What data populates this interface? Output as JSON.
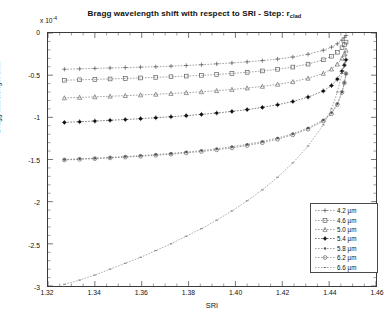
{
  "chart_data": {
    "type": "line",
    "title": "Bragg wavelength shift with respect to SRI - Step: r",
    "title_sub": "clad",
    "xlabel": "SRI",
    "ylabel": "Bragg wavelength shift",
    "y_multiplier": "x 10",
    "y_multiplier_exp": "-4",
    "xlim": [
      1.32,
      1.46
    ],
    "ylim": [
      -3,
      0
    ],
    "xticks": [
      "1.32",
      "1.34",
      "1.36",
      "1.38",
      "1.40",
      "1.42",
      "1.44",
      "1.46"
    ],
    "xtick_values": [
      1.32,
      1.34,
      1.36,
      1.38,
      1.4,
      1.42,
      1.44,
      1.46
    ],
    "yticks": [
      "0",
      "-0.5",
      "-1",
      "-1.5",
      "-2",
      "-2.5",
      "-3"
    ],
    "ytick_values": [
      0,
      -0.5,
      -1,
      -1.5,
      -2,
      -2.5,
      -3
    ],
    "grid": false,
    "minor_ticks": true,
    "legend_position": "lower right",
    "legend_title": "",
    "x": [
      1.327,
      1.3335,
      1.34,
      1.3465,
      1.353,
      1.3595,
      1.366,
      1.3725,
      1.379,
      1.3855,
      1.392,
      1.3985,
      1.405,
      1.4115,
      1.418,
      1.4245,
      1.431,
      1.4375,
      1.441,
      1.4435,
      1.4455,
      1.4465,
      1.4472
    ],
    "series": [
      {
        "name": "4.2 µm",
        "marker": "plus",
        "filled": false,
        "color": "#555555",
        "values": [
          -0.43,
          -0.425,
          -0.42,
          -0.415,
          -0.41,
          -0.405,
          -0.4,
          -0.393,
          -0.385,
          -0.376,
          -0.366,
          -0.355,
          -0.342,
          -0.327,
          -0.309,
          -0.285,
          -0.252,
          -0.205,
          -0.168,
          -0.128,
          -0.085,
          -0.055,
          -0.03
        ]
      },
      {
        "name": "4.6 µm",
        "marker": "square",
        "filled": false,
        "color": "#555555",
        "values": [
          -0.56,
          -0.555,
          -0.55,
          -0.545,
          -0.539,
          -0.533,
          -0.526,
          -0.519,
          -0.511,
          -0.502,
          -0.492,
          -0.48,
          -0.466,
          -0.45,
          -0.43,
          -0.404,
          -0.369,
          -0.318,
          -0.275,
          -0.228,
          -0.175,
          -0.138,
          -0.108
        ]
      },
      {
        "name": "5.0 µm",
        "marker": "triangle",
        "filled": false,
        "color": "#555555",
        "values": [
          -0.77,
          -0.764,
          -0.757,
          -0.75,
          -0.743,
          -0.735,
          -0.727,
          -0.718,
          -0.708,
          -0.697,
          -0.684,
          -0.67,
          -0.653,
          -0.633,
          -0.609,
          -0.578,
          -0.537,
          -0.479,
          -0.428,
          -0.37,
          -0.3,
          -0.25,
          -0.205
        ]
      },
      {
        "name": "5.4 µm",
        "marker": "star",
        "filled": true,
        "color": "#111111",
        "values": [
          -1.06,
          -1.052,
          -1.044,
          -1.035,
          -1.026,
          -1.016,
          -1.005,
          -0.993,
          -0.98,
          -0.965,
          -0.949,
          -0.93,
          -0.908,
          -0.882,
          -0.851,
          -0.812,
          -0.76,
          -0.688,
          -0.623,
          -0.546,
          -0.452,
          -0.382,
          -0.318
        ]
      },
      {
        "name": "5.8 µm",
        "marker": "dot",
        "filled": true,
        "color": "#555555",
        "values": [
          -1.5,
          -1.492,
          -1.484,
          -1.475,
          -1.465,
          -1.454,
          -1.442,
          -1.428,
          -1.412,
          -1.394,
          -1.373,
          -1.349,
          -1.321,
          -1.287,
          -1.246,
          -1.194,
          -1.126,
          -1.032,
          -0.947,
          -0.84,
          -0.7,
          -0.59,
          -0.48
        ]
      },
      {
        "name": "6.2 µm",
        "marker": "circle",
        "filled": false,
        "color": "#555555",
        "values": [
          -1.505,
          -1.498,
          -1.49,
          -1.481,
          -1.472,
          -1.462,
          -1.45,
          -1.437,
          -1.422,
          -1.405,
          -1.385,
          -1.362,
          -1.334,
          -1.301,
          -1.26,
          -1.208,
          -1.14,
          -1.044,
          -0.958,
          -0.848,
          -0.704,
          -0.592,
          -0.482
        ]
      },
      {
        "name": "6.6 µm",
        "marker": "dash",
        "filled": false,
        "color": "#666666",
        "values": [
          -2.98,
          -2.93,
          -2.87,
          -2.8,
          -2.73,
          -2.66,
          -2.58,
          -2.5,
          -2.41,
          -2.32,
          -2.22,
          -2.11,
          -1.99,
          -1.86,
          -1.71,
          -1.54,
          -1.34,
          -1.09,
          -0.9,
          -0.7,
          -0.48,
          -0.36,
          -0.26
        ]
      }
    ]
  }
}
